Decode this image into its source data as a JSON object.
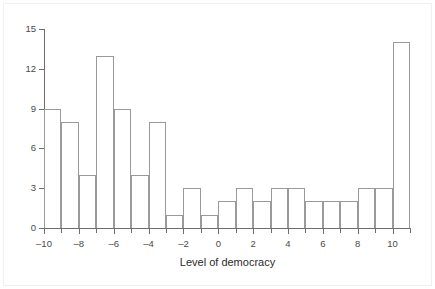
{
  "chart_data": {
    "type": "bar",
    "title": "",
    "subtitle": "",
    "xlabel": "Level of democracy",
    "ylabel": "",
    "xlim": [
      -10,
      11
    ],
    "ylim": [
      0,
      15
    ],
    "grid": false,
    "legend": null,
    "bin_width": 1,
    "x_tick_labels": [
      "-10",
      "-8",
      "-6",
      "-4",
      "-2",
      "0",
      "2",
      "4",
      "6",
      "8",
      "10"
    ],
    "x_tick_values": [
      -10,
      -8,
      -6,
      -4,
      -2,
      0,
      2,
      4,
      6,
      8,
      10
    ],
    "x_minor_tick_values": [
      -9,
      -7,
      -5,
      -3,
      -1,
      1,
      3,
      5,
      7,
      9,
      11
    ],
    "y_tick_labels": [
      "0",
      "3",
      "6",
      "9",
      "12",
      "15"
    ],
    "y_tick_values": [
      0,
      3,
      6,
      9,
      12,
      15
    ],
    "bin_starts": [
      -10,
      -9,
      -8,
      -7,
      -6,
      -5,
      -4,
      -3,
      -2,
      -1,
      0,
      1,
      2,
      3,
      4,
      5,
      6,
      7,
      8,
      9,
      10
    ],
    "values": [
      9,
      8,
      4,
      13,
      9,
      4,
      8,
      1,
      3,
      1,
      2,
      3,
      2,
      3,
      3,
      2,
      2,
      2,
      3,
      3,
      14
    ],
    "bar_line_color": "#9a9a9a",
    "axis_color": "#6e6e6e",
    "background_color": "#ffffff"
  }
}
